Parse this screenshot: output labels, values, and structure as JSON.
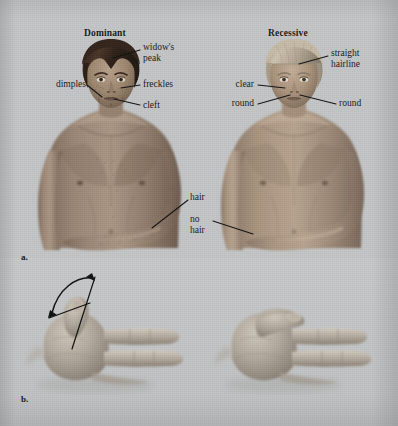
{
  "figure": {
    "background_color": "#c3c5c6",
    "ink_color": "#131313",
    "panels": [
      {
        "id": "a",
        "label": "a.",
        "caption": "Facial and body traits"
      },
      {
        "id": "b",
        "label": "b.",
        "caption": "Thumb traits"
      }
    ]
  },
  "panel_a": {
    "columns": [
      {
        "heading": "Dominant",
        "figure_name": "dominant-person-illustration",
        "skin_tone": "#8d7766",
        "hair_color": "#3a2a20",
        "callouts": [
          {
            "name": "widows-peak",
            "text": "widow's\npeak"
          },
          {
            "name": "dimples",
            "text": "dimples"
          },
          {
            "name": "freckles",
            "text": "freckles"
          },
          {
            "name": "cleft",
            "text": "cleft"
          },
          {
            "name": "hair",
            "text": "hair"
          }
        ]
      },
      {
        "heading": "Recessive",
        "figure_name": "recessive-person-illustration",
        "skin_tone": "#a08b79",
        "hair_color": "#b6a894",
        "callouts": [
          {
            "name": "straight-hairline",
            "text": "straight\nhairline"
          },
          {
            "name": "clear",
            "text": "clear"
          },
          {
            "name": "round-left",
            "text": "round"
          },
          {
            "name": "round-right",
            "text": "round"
          },
          {
            "name": "no-hair",
            "text": "no\nhair"
          }
        ]
      }
    ]
  },
  "panel_b": {
    "hands": [
      {
        "name": "hitchhikers-thumb-hand",
        "trait": "hitchhiker's thumb",
        "inheritance": "Recessive",
        "angle_marker": true
      },
      {
        "name": "straight-thumb-hand",
        "trait": "straight thumb",
        "inheritance": "Dominant",
        "angle_marker": false
      }
    ]
  }
}
